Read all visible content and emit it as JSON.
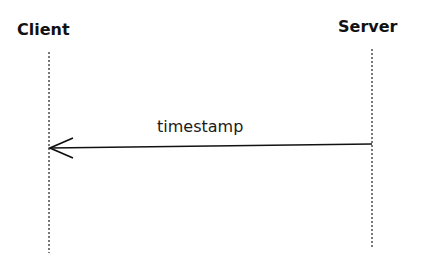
{
  "diagram": {
    "type": "sequence",
    "participants": [
      {
        "id": "client",
        "label": "Client"
      },
      {
        "id": "server",
        "label": "Server"
      }
    ],
    "messages": [
      {
        "from": "server",
        "to": "client",
        "label": "timestamp"
      }
    ],
    "colors": {
      "line": "#111111",
      "background": "#ffffff"
    }
  }
}
